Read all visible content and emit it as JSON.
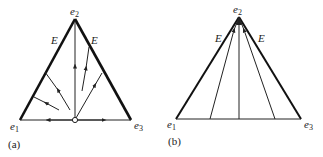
{
  "figure": {
    "panel_a": {
      "caption": "(a)",
      "vertex_labels": {
        "top": "e",
        "top_sub": "2",
        "left": "e",
        "left_sub": "1",
        "right": "e",
        "right_sub": "3"
      },
      "edge_label_left": "E",
      "edge_label_right": "E"
    },
    "panel_b": {
      "caption": "(b)",
      "vertex_labels": {
        "top": "e",
        "top_sub": "2",
        "left": "e",
        "left_sub": "1",
        "right": "e",
        "right_sub": "3"
      },
      "edge_label_left": "E",
      "edge_label_right": "E"
    }
  }
}
